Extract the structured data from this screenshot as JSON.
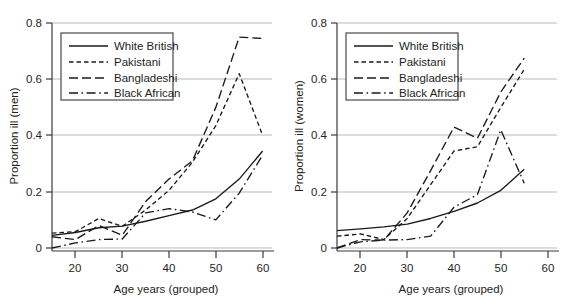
{
  "figure": {
    "cropped_header_text": "",
    "panels_count": 2
  },
  "legend": {
    "entries": [
      {
        "label": "White British",
        "style": "solid",
        "key": "white_british"
      },
      {
        "label": "Pakistani",
        "style": "short-dash",
        "key": "pakistani"
      },
      {
        "label": "Bangladeshi",
        "style": "long-dash",
        "key": "bangladeshi"
      },
      {
        "label": "Black African",
        "style": "dash-dot",
        "key": "black_african"
      }
    ]
  },
  "chart_data": [
    {
      "id": "men",
      "type": "line",
      "title": "",
      "xlabel": "Age years (grouped)",
      "ylabel": "Proportion ill (men)",
      "xlim": [
        15,
        62
      ],
      "ylim": [
        0,
        0.8
      ],
      "xticks": [
        20,
        30,
        40,
        50,
        60
      ],
      "xtick_labels": [
        "20",
        "30",
        "40",
        "50",
        "60"
      ],
      "yticks": [
        0,
        0.2,
        0.4,
        0.6,
        0.8
      ],
      "ytick_labels": [
        "0",
        "0.2",
        "0.4",
        "0.6",
        "0.8"
      ],
      "grid": "horizontal",
      "legend_position": "upper-left",
      "series": [
        {
          "name": "White British",
          "key": "white_british",
          "x": [
            15,
            20,
            25,
            30,
            35,
            40,
            45,
            50,
            55,
            60
          ],
          "values": [
            0.045,
            0.055,
            0.072,
            0.078,
            0.095,
            0.115,
            0.135,
            0.175,
            0.245,
            0.345
          ]
        },
        {
          "name": "Pakistani",
          "key": "pakistani",
          "x": [
            15,
            20,
            25,
            30,
            35,
            40,
            45,
            50,
            55,
            60
          ],
          "values": [
            0.053,
            0.058,
            0.105,
            0.077,
            0.135,
            0.205,
            0.305,
            0.435,
            0.62,
            0.4
          ]
        },
        {
          "name": "Bangladeshi",
          "key": "bangladeshi",
          "x": [
            15,
            20,
            25,
            30,
            35,
            40,
            45,
            50,
            55,
            60
          ],
          "values": [
            0.04,
            0.03,
            0.08,
            0.045,
            0.165,
            0.245,
            0.31,
            0.5,
            0.75,
            0.745
          ]
        },
        {
          "name": "Black African",
          "key": "black_african",
          "x": [
            15,
            20,
            25,
            30,
            35,
            40,
            45,
            50,
            55,
            60
          ],
          "values": [
            0.0,
            0.018,
            0.03,
            0.032,
            0.125,
            0.14,
            0.128,
            0.1,
            0.195,
            0.33
          ]
        }
      ]
    },
    {
      "id": "women",
      "type": "line",
      "title": "",
      "xlabel": "Age years (grouped)",
      "ylabel": "Proportion ill (women)",
      "xlim": [
        15,
        62
      ],
      "ylim": [
        0,
        0.8
      ],
      "xticks": [
        20,
        30,
        40,
        50,
        60
      ],
      "xtick_labels": [
        "20",
        "30",
        "40",
        "50",
        "60"
      ],
      "yticks": [
        0,
        0.2,
        0.4,
        0.6,
        0.8
      ],
      "ytick_labels": [
        "0",
        "0.2",
        "0.4",
        "0.6",
        "0.8"
      ],
      "grid": "horizontal",
      "legend_position": "upper-left",
      "series": [
        {
          "name": "White British",
          "key": "white_british",
          "x": [
            15,
            20,
            25,
            30,
            35,
            40,
            45,
            50,
            55
          ],
          "values": [
            0.062,
            0.068,
            0.075,
            0.085,
            0.105,
            0.13,
            0.16,
            0.205,
            0.28
          ]
        },
        {
          "name": "Pakistani",
          "key": "pakistani",
          "x": [
            15,
            20,
            25,
            30,
            35,
            40,
            45,
            50,
            55
          ],
          "values": [
            0.042,
            0.05,
            0.03,
            0.105,
            0.225,
            0.345,
            0.36,
            0.5,
            0.635
          ]
        },
        {
          "name": "Bangladeshi",
          "key": "bangladeshi",
          "x": [
            15,
            20,
            25,
            30,
            35,
            40,
            45,
            50,
            55
          ],
          "values": [
            0.0,
            0.03,
            0.028,
            0.125,
            0.275,
            0.43,
            0.39,
            0.555,
            0.675
          ]
        },
        {
          "name": "Black African",
          "key": "black_african",
          "x": [
            15,
            20,
            25,
            30,
            35,
            40,
            45,
            50,
            55
          ],
          "values": [
            0.0,
            0.022,
            0.028,
            0.03,
            0.042,
            0.145,
            0.19,
            0.42,
            0.23
          ]
        }
      ]
    }
  ]
}
